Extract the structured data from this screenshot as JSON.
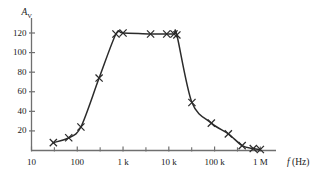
{
  "chart_data": {
    "type": "line",
    "title": "",
    "subtitle": "",
    "xlabel": "f (Hz)",
    "ylabel": "A_V",
    "xscale": "log",
    "yscale": "linear",
    "xlim": [
      10,
      3000000
    ],
    "ylim": [
      0,
      132
    ],
    "grid": false,
    "legend_position": "none",
    "marker": "x",
    "line_color": "#2b2b2b",
    "axis_color": "#6f6f6f",
    "x_tick_labels": [
      "10",
      "100",
      "1 k",
      "10 k",
      "100 k",
      "1 M"
    ],
    "x_tick_values": [
      10,
      100,
      1000,
      10000,
      100000,
      1000000
    ],
    "y_tick_labels": [
      "20",
      "40",
      "60",
      "80",
      "100",
      "120"
    ],
    "y_tick_values": [
      20,
      40,
      60,
      80,
      100,
      120
    ],
    "series": [
      {
        "name": "voltage gain",
        "x": [
          30,
          65,
          120,
          300,
          700,
          1000,
          4000,
          9000,
          13000,
          15000,
          32000,
          85000,
          200000,
          400000,
          700000,
          1000000
        ],
        "y": [
          8,
          13,
          24,
          74,
          119,
          120,
          119,
          119,
          119,
          118,
          49,
          28,
          17,
          5,
          2,
          1
        ]
      }
    ],
    "annotations": []
  },
  "axes": {
    "y_axis_name": "A",
    "y_axis_subscript": "V",
    "x_axis_name": "f",
    "x_axis_units": "(Hz)"
  }
}
